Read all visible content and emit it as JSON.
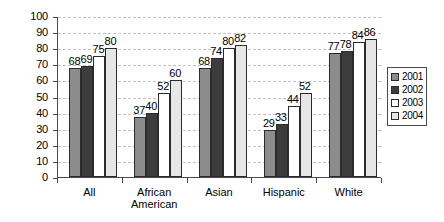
{
  "chart_data": {
    "type": "bar",
    "title": "",
    "xlabel": "",
    "ylabel": "",
    "ylim": [
      0,
      100
    ],
    "y_ticks": [
      0,
      10,
      20,
      30,
      40,
      50,
      60,
      70,
      80,
      90,
      100
    ],
    "grid": true,
    "legend_position": "right",
    "categories": [
      "All",
      "African American",
      "Asian",
      "Hispanic",
      "White"
    ],
    "category_lines": [
      [
        "All"
      ],
      [
        "African",
        "American"
      ],
      [
        "Asian"
      ],
      [
        "Hispanic"
      ],
      [
        "White"
      ]
    ],
    "series": [
      {
        "name": "2001",
        "color": "#8c8c8c",
        "values": [
          68,
          37,
          68,
          29,
          77
        ]
      },
      {
        "name": "2002",
        "color": "#3c3c3c",
        "values": [
          69,
          40,
          74,
          33,
          78
        ]
      },
      {
        "name": "2003",
        "color": "#ffffff",
        "values": [
          75,
          52,
          80,
          44,
          84
        ]
      },
      {
        "name": "2004",
        "color": "#e6e6e6",
        "values": [
          80,
          60,
          82,
          52,
          86
        ]
      }
    ]
  },
  "legend": {
    "items": [
      {
        "label": "2001",
        "color": "#8c8c8c"
      },
      {
        "label": "2002",
        "color": "#3c3c3c"
      },
      {
        "label": "2003",
        "color": "#ffffff"
      },
      {
        "label": "2004",
        "color": "#e6e6e6"
      }
    ]
  },
  "colors": {
    "axis": "#4a4a4a",
    "grid": "#c2c2c2",
    "bar_outline": "#2b2b2b",
    "text": "#000000",
    "background": "#ffffff"
  }
}
